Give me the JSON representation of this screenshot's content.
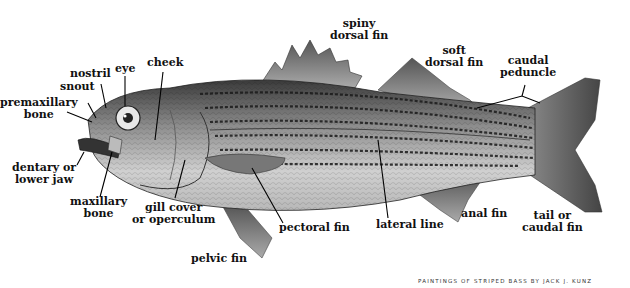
{
  "diagram": {
    "labels": {
      "spiny_dorsal_fin": [
        "spiny",
        "dorsal fin"
      ],
      "soft_dorsal_fin": [
        "soft",
        "dorsal fin"
      ],
      "caudal_peduncle": [
        "caudal",
        "peduncle"
      ],
      "cheek": [
        "cheek"
      ],
      "eye": [
        "eye"
      ],
      "nostril": [
        "nostril"
      ],
      "snout": [
        "snout"
      ],
      "premaxillary_bone": [
        "premaxillary",
        "bone"
      ],
      "dentary": [
        "dentary or",
        "lower jaw"
      ],
      "maxillary_bone": [
        "maxillary",
        "bone"
      ],
      "gill_cover": [
        "gill cover",
        "or operculum"
      ],
      "pectoral_fin": [
        "pectoral fin"
      ],
      "lateral_line": [
        "lateral line"
      ],
      "anal_fin": [
        "anal fin"
      ],
      "tail": [
        "tail or",
        "caudal fin"
      ],
      "pelvic_fin": [
        "pelvic fin"
      ]
    },
    "credit": "PAINTINGS OF STRIPED BASS BY JACK J. KUNZ"
  }
}
